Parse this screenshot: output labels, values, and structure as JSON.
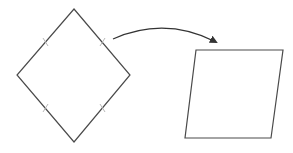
{
  "diagram": {
    "colors": {
      "stroke": "#4a4a4a",
      "tick": "#b8b8b8",
      "arrow": "#333333",
      "background": "#ffffff"
    },
    "shapes": [
      {
        "name": "rhombus",
        "points": [
          [
            74,
            9
          ],
          [
            130,
            75
          ],
          [
            74,
            142
          ],
          [
            17,
            75
          ]
        ],
        "tick_marks": 4
      },
      {
        "name": "parallelogram",
        "points": [
          [
            196,
            50
          ],
          [
            283,
            50
          ],
          [
            271,
            138
          ],
          [
            185,
            138
          ]
        ]
      }
    ],
    "arrow": {
      "from": [
        113,
        39
      ],
      "to": [
        218,
        43
      ],
      "curve": "arc"
    }
  }
}
